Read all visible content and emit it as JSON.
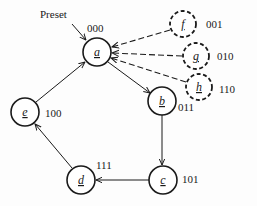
{
  "diagram": {
    "type": "state-diagram",
    "preset_label": "Preset",
    "nodes": [
      {
        "id": "a",
        "label": "a",
        "code": "000",
        "style": "solid"
      },
      {
        "id": "b",
        "label": "b",
        "code": "011",
        "style": "solid"
      },
      {
        "id": "c",
        "label": "c",
        "code": "101",
        "style": "solid"
      },
      {
        "id": "d",
        "label": "d",
        "code": "111",
        "style": "solid"
      },
      {
        "id": "e",
        "label": "e",
        "code": "100",
        "style": "solid"
      },
      {
        "id": "f",
        "label": "f",
        "code": "001",
        "style": "dashed"
      },
      {
        "id": "g",
        "label": "g",
        "code": "010",
        "style": "dashed"
      },
      {
        "id": "h",
        "label": "h",
        "code": "110",
        "style": "dashed"
      }
    ],
    "edges": [
      {
        "from": "Preset",
        "to": "a",
        "style": "solid"
      },
      {
        "from": "a",
        "to": "b",
        "style": "solid"
      },
      {
        "from": "b",
        "to": "c",
        "style": "solid"
      },
      {
        "from": "c",
        "to": "d",
        "style": "solid"
      },
      {
        "from": "d",
        "to": "e",
        "style": "solid"
      },
      {
        "from": "e",
        "to": "a",
        "style": "solid"
      },
      {
        "from": "f",
        "to": "a",
        "style": "dashed"
      },
      {
        "from": "g",
        "to": "a",
        "style": "dashed"
      },
      {
        "from": "h",
        "to": "a",
        "style": "dashed"
      }
    ]
  }
}
